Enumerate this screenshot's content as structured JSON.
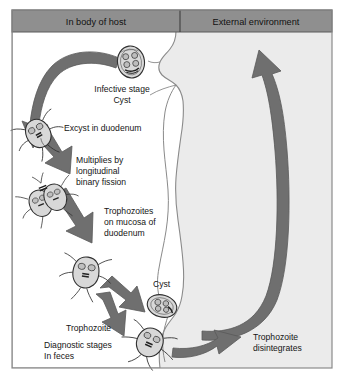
{
  "figure": {
    "title_in_body": "In body of host",
    "title_external": "External environment",
    "panel_divider_x": 180,
    "colors": {
      "header_fill": "#8f8f8f",
      "header_stroke": "#5a5a5a",
      "panel_bg": "#ebebeb",
      "body_fill": "#ffffff",
      "body_stroke": "#8a8a8a",
      "arrow_fill": "#6f6f6f",
      "arrow_stroke": "#5a5a5a",
      "organism_fill": "#d6d6d6",
      "organism_stroke": "#2f2f2f",
      "text": "#151515"
    }
  },
  "labels": [
    {
      "id": "infective-stage-cyst",
      "lines": [
        "Infective stage",
        "Cyst"
      ],
      "x": 122,
      "y": 92,
      "align": "middle"
    },
    {
      "id": "excyst-in-duodenum",
      "lines": [
        "Excyst in duodenum"
      ],
      "x": 64,
      "y": 131,
      "align": "start"
    },
    {
      "id": "multiplies-binary-fission",
      "lines": [
        "Multiplies by",
        "longitudinal",
        "binary fission"
      ],
      "x": 76,
      "y": 163,
      "align": "start"
    },
    {
      "id": "trophozoites-on-mucosa",
      "lines": [
        "Trophozoites",
        "on mucosa of",
        "duodenum"
      ],
      "x": 104,
      "y": 214,
      "align": "start"
    },
    {
      "id": "cyst",
      "lines": [
        "Cyst"
      ],
      "x": 153,
      "y": 287,
      "align": "start"
    },
    {
      "id": "trophozoite",
      "lines": [
        "Trophozoite"
      ],
      "x": 66,
      "y": 331,
      "align": "start"
    },
    {
      "id": "diagnostic-stages-in-feces",
      "lines": [
        "Diagnostic stages",
        "In feces"
      ],
      "x": 44,
      "y": 348,
      "align": "start"
    },
    {
      "id": "trophozoite-disintegrates",
      "lines": [
        "Trophozoite",
        "disintegrates"
      ],
      "x": 253,
      "y": 340,
      "align": "start"
    }
  ],
  "organisms": [
    {
      "id": "cyst-infective",
      "type": "cyst",
      "x": 131,
      "y": 62,
      "r": 14,
      "rot": -8
    },
    {
      "id": "trophozoite-excysting",
      "type": "trophozoite",
      "x": 38,
      "y": 133,
      "size": 26,
      "rot": -35
    },
    {
      "id": "trophozoite-dividing",
      "type": "trophozoite-pair",
      "x": 47,
      "y": 198,
      "size": 26,
      "rot": -30
    },
    {
      "id": "trophozoite-mucosa",
      "type": "trophozoite",
      "x": 86,
      "y": 272,
      "size": 28,
      "rot": 10
    },
    {
      "id": "cyst-feces",
      "type": "cyst",
      "x": 162,
      "y": 306,
      "r": 15,
      "rot": 14
    },
    {
      "id": "trophozoite-feces",
      "type": "trophozoite",
      "x": 150,
      "y": 342,
      "size": 27,
      "rot": 30
    }
  ],
  "arrows": [
    {
      "id": "arrow-mouth-to-duodenum",
      "desc": "curved arrow from cyst down left side"
    },
    {
      "id": "arrow-fission-to-mucosa",
      "desc": "arrow toward trophozoites on mucosa"
    },
    {
      "id": "arrow-mucosa-to-cyst",
      "desc": "arrow toward cyst in feces"
    },
    {
      "id": "arrow-mucosa-to-trophozoite",
      "desc": "arrow toward trophozoite in feces"
    },
    {
      "id": "arrow-feces-to-external",
      "desc": "arrow to trophozoite disintegrates"
    },
    {
      "id": "arrow-external-to-mouth",
      "desc": "large curved arrow back to mouth"
    }
  ]
}
